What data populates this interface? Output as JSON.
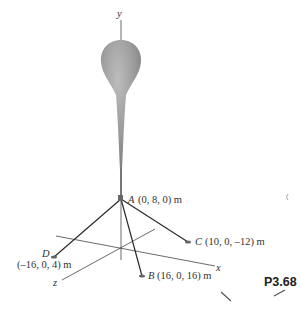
{
  "figure": {
    "problem_number": "P3.68",
    "axes": {
      "x": "x",
      "y": "y",
      "z": "z"
    },
    "points": [
      {
        "name": "A",
        "coords": "(0, 8, 0) m"
      },
      {
        "name": "B",
        "coords": "(16, 0, 16) m"
      },
      {
        "name": "C",
        "coords": "(10, 0, –12) m"
      },
      {
        "name": "D",
        "coords": "(–16, 0, 4) m"
      }
    ],
    "object": "balloon tethered at A by cables AB, AC, AD"
  }
}
